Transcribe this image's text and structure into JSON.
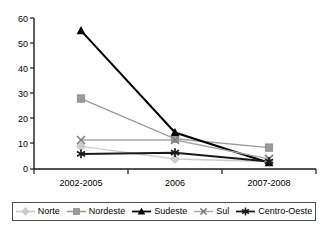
{
  "chart_data": {
    "type": "line",
    "title": "",
    "subtitle": "",
    "xlabel": "",
    "ylabel": "",
    "categories": [
      "2002-2005",
      "2006",
      "2007-2008"
    ],
    "ylim": [
      0,
      60
    ],
    "yticks": [
      0,
      10,
      20,
      30,
      40,
      50,
      60
    ],
    "ytick_labels": [
      "0",
      "10",
      "20",
      "30",
      "40",
      "50",
      "60"
    ],
    "grid": false,
    "legend_position": "bottom",
    "series": [
      {
        "name": "Norte",
        "values": [
          9,
          4,
          3
        ],
        "color": "#cccccc",
        "marker": "diamond"
      },
      {
        "name": "Nordeste",
        "values": [
          28,
          12,
          8.5
        ],
        "color": "#9a9a9a",
        "marker": "square"
      },
      {
        "name": "Sudeste",
        "values": [
          55,
          14.5,
          2.5
        ],
        "color": "#000000",
        "marker": "triangle"
      },
      {
        "name": "Sul",
        "values": [
          11.5,
          11.5,
          4
        ],
        "color": "#a6a6a6",
        "marker": "x"
      },
      {
        "name": "Centro-Oeste",
        "values": [
          6,
          6.5,
          3
        ],
        "color": "#1a1a1a",
        "marker": "star"
      }
    ]
  },
  "axes": {
    "y_tick_labels": [
      "60",
      "50",
      "40",
      "30",
      "20",
      "10",
      "0"
    ],
    "x_tick_labels": [
      "2002-2005",
      "2006",
      "2007-2008"
    ]
  },
  "legend": {
    "items": [
      {
        "label": "Norte",
        "marker": "diamond-marker-icon",
        "color": "#cccccc"
      },
      {
        "label": "Nordeste",
        "marker": "square-marker-icon",
        "color": "#9a9a9a"
      },
      {
        "label": "Sudeste",
        "marker": "triangle-marker-icon",
        "color": "#000000"
      },
      {
        "label": "Sul",
        "marker": "x-marker-icon",
        "color": "#a6a6a6"
      },
      {
        "label": "Centro-Oeste",
        "marker": "star-marker-icon",
        "color": "#1a1a1a"
      }
    ]
  }
}
